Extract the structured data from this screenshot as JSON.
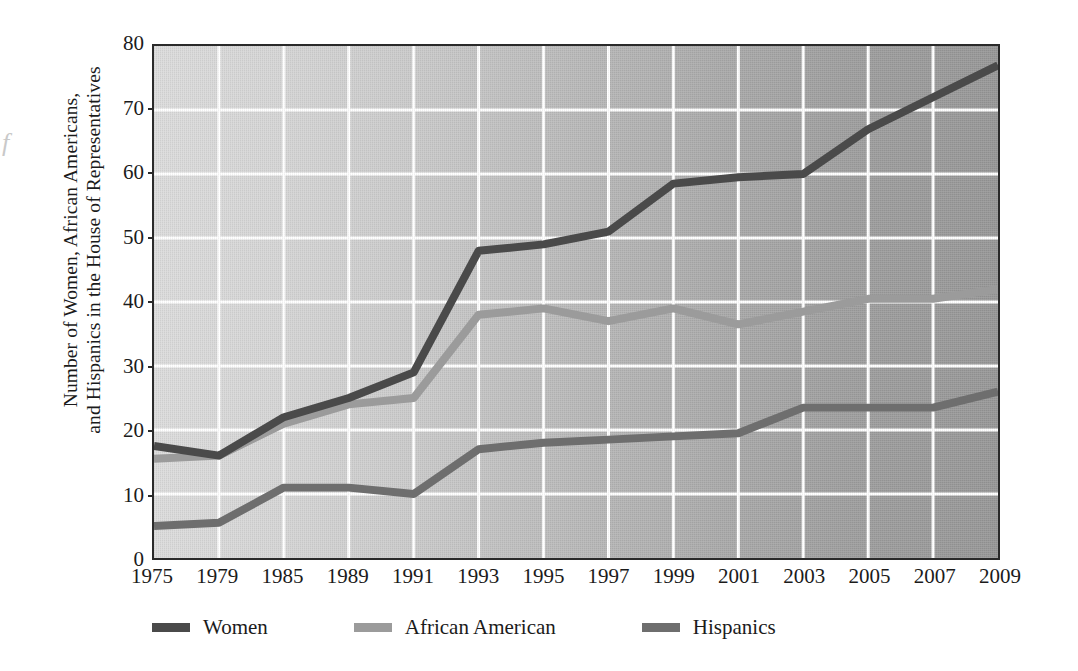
{
  "page": {
    "bleed_glyph": "f"
  },
  "chart_data": {
    "type": "line",
    "title": "",
    "xlabel": "",
    "ylabel": "Number of Women, African Americans, and Hispanics in the House of Representatives",
    "ylabel_lines": [
      "Number of Women, African Americans,",
      "and Hispanics in the House of Representatives"
    ],
    "categories": [
      "1975",
      "1979",
      "1985",
      "1989",
      "1991",
      "1993",
      "1995",
      "1997",
      "1999",
      "2001",
      "2003",
      "2005",
      "2007",
      "2009"
    ],
    "x": [
      1975,
      1979,
      1985,
      1989,
      1991,
      1993,
      1995,
      1997,
      1999,
      2001,
      2003,
      2005,
      2007,
      2009
    ],
    "ylim": [
      0,
      80
    ],
    "yticks": [
      0,
      10,
      20,
      30,
      40,
      50,
      60,
      70,
      80
    ],
    "ytick_labels": [
      "0",
      "10",
      "20",
      "30",
      "40",
      "50",
      "60",
      "70",
      "80"
    ],
    "grid": true,
    "grid_color": "#ffffff",
    "legend_position": "below",
    "series": [
      {
        "name": "Women",
        "color": "#4a4a4a",
        "values": [
          17.5,
          16,
          22,
          25,
          29,
          48,
          49,
          51,
          58.5,
          59.5,
          60,
          67,
          72,
          77
        ]
      },
      {
        "name": "African American",
        "color": "#9b9b9b",
        "values": [
          15.5,
          16,
          21,
          24,
          25,
          38,
          39,
          37,
          39,
          36.5,
          38.5,
          40.5,
          40.5,
          42
        ]
      },
      {
        "name": "Hispanics",
        "color": "#6e6e6e",
        "values": [
          5,
          5.5,
          11,
          11,
          10,
          17,
          18,
          18.5,
          19,
          19.5,
          23.5,
          23.5,
          23.5,
          26
        ]
      }
    ]
  }
}
